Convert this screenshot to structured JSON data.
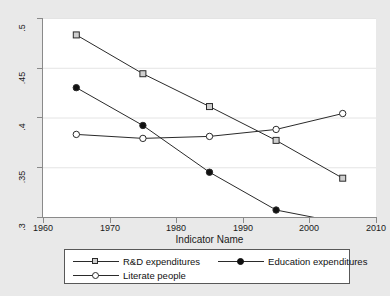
{
  "chart_data": {
    "type": "line",
    "title": "",
    "xlabel": "Indicator Name",
    "ylabel": "",
    "xlim": [
      1960,
      2010
    ],
    "ylim": [
      0.3,
      0.5
    ],
    "x": [
      1965,
      1975,
      1985,
      1995,
      2005
    ],
    "xticks": [
      1960,
      1970,
      1980,
      1990,
      2000,
      2010
    ],
    "xtick_labels": [
      "1960",
      "1970",
      "1980",
      "1990",
      "2000",
      "2010"
    ],
    "yticks": [
      0.3,
      0.35,
      0.4,
      0.45,
      0.5
    ],
    "ytick_labels": [
      ".3",
      ".35",
      ".4",
      ".45",
      ".5"
    ],
    "grid": "horizontal",
    "legend_position": "bottom",
    "series": [
      {
        "name": "R&D expenditures",
        "marker": "square",
        "values": [
          0.483,
          0.444,
          0.411,
          0.377,
          0.339
        ]
      },
      {
        "name": "Education expenditures",
        "marker": "filled-circle",
        "values": [
          0.43,
          0.392,
          0.345,
          0.307,
          0.294
        ]
      },
      {
        "name": "Literate people",
        "marker": "open-circle",
        "values": [
          0.383,
          0.379,
          0.381,
          0.388,
          0.404
        ]
      }
    ]
  },
  "colors": {
    "figure_background": "#e9e9e9",
    "plot_background": "#ffffff",
    "axis": "#8a8a8a",
    "gridline": "#e4e4e4",
    "line": "#2a2a2a",
    "legend_border": "#585858",
    "text": "#1a1a1a"
  },
  "legend": {
    "entries": [
      {
        "label": "R&D expenditures",
        "marker": "square"
      },
      {
        "label": "Education expenditures",
        "marker": "filled-circle"
      },
      {
        "label": "Literate people",
        "marker": "open-circle"
      }
    ]
  }
}
